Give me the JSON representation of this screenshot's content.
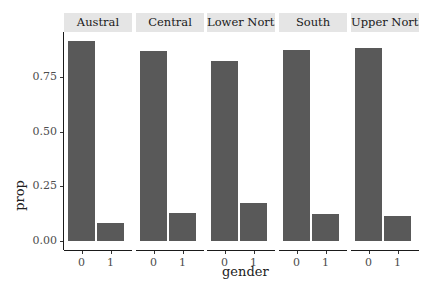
{
  "chart_data": {
    "type": "bar",
    "title": "",
    "xlabel": "gender",
    "ylabel": "prop",
    "ylim": [
      0,
      0.95
    ],
    "yticks": [
      "0.00",
      "0.25",
      "0.50",
      "0.75"
    ],
    "categories": [
      "0",
      "1"
    ],
    "facets": [
      "Austral",
      "Central",
      "Lower North",
      "South",
      "Upper North"
    ],
    "series": [
      {
        "name": "Austral",
        "values": [
          0.915,
          0.083
        ]
      },
      {
        "name": "Central",
        "values": [
          0.87,
          0.128
        ]
      },
      {
        "name": "Lower North",
        "values": [
          0.824,
          0.174
        ]
      },
      {
        "name": "South",
        "values": [
          0.874,
          0.124
        ]
      },
      {
        "name": "Upper North",
        "values": [
          0.883,
          0.115
        ]
      }
    ],
    "grid": false,
    "legend": "none",
    "colors": {
      "bar": "#595959",
      "strip": "#e5e5e5",
      "axis": "#1a1a1a"
    }
  }
}
